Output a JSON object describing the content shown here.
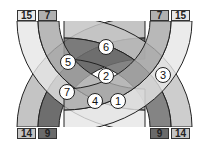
{
  "diagram": {
    "type": "crossing-bands",
    "colors": {
      "outer_band": "#d9d9d9",
      "inner_band": "#a6a6a6",
      "inner_band_bottom": "#6e6e6e",
      "outer_band_bottom": "#bdbdbd",
      "overlap_dark": "#5a5a5a",
      "overlap_mid": "#8c8c8c",
      "stroke": "#222222",
      "background": "#ffffff"
    },
    "top_labels": [
      {
        "text": "15",
        "pos": "top-left-outer",
        "fill": "#e8e8e8"
      },
      {
        "text": "7",
        "pos": "top-left-inner",
        "fill": "#b0b0b0"
      },
      {
        "text": "7",
        "pos": "top-right-inner",
        "fill": "#b0b0b0"
      },
      {
        "text": "15",
        "pos": "top-right-outer",
        "fill": "#e8e8e8"
      }
    ],
    "bottom_labels": [
      {
        "text": "14",
        "pos": "bottom-left-outer",
        "fill": "#c4c4c4"
      },
      {
        "text": "9",
        "pos": "bottom-left-inner",
        "fill": "#6a6a6a"
      },
      {
        "text": "9",
        "pos": "bottom-right-inner",
        "fill": "#6a6a6a"
      },
      {
        "text": "14",
        "pos": "bottom-right-outer",
        "fill": "#c4c4c4"
      }
    ],
    "markers": [
      {
        "text": "6",
        "x": 106,
        "y": 47
      },
      {
        "text": "5",
        "x": 68,
        "y": 62
      },
      {
        "text": "2",
        "x": 106,
        "y": 76
      },
      {
        "text": "3",
        "x": 163,
        "y": 75
      },
      {
        "text": "7",
        "x": 67,
        "y": 92
      },
      {
        "text": "4",
        "x": 95,
        "y": 101
      },
      {
        "text": "1",
        "x": 118,
        "y": 101
      }
    ]
  }
}
